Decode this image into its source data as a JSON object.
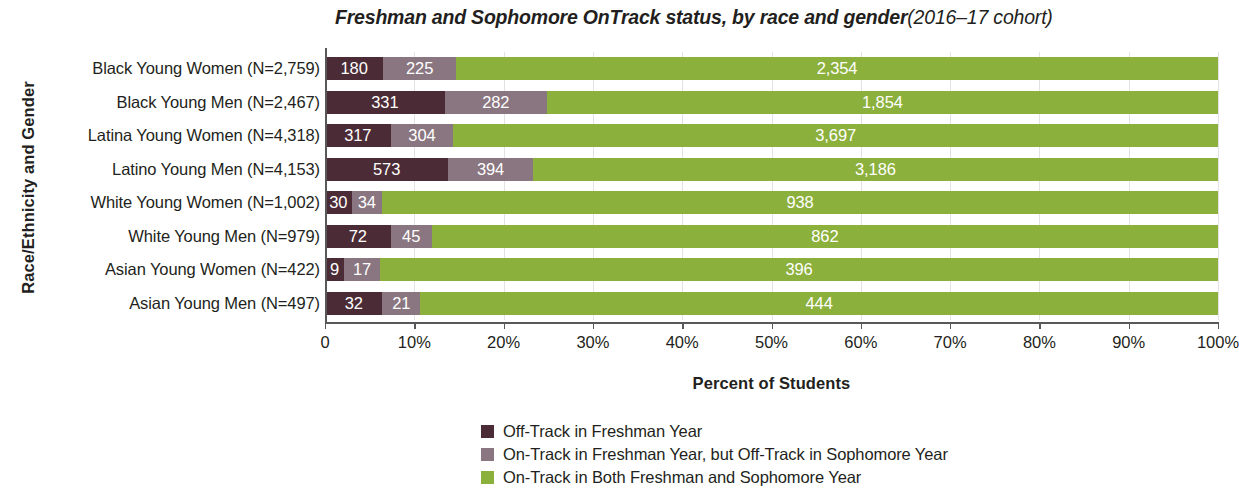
{
  "chart_data": {
    "type": "bar",
    "orientation": "horizontal",
    "stacked": true,
    "normalized": "percent",
    "title_main": "Freshman and Sophomore OnTrack status, by race and gender",
    "title_sub": "(2016–17 cohort)",
    "xlabel": "Percent of Students",
    "ylabel": "Race/Ethnicity and Gender",
    "xlim": [
      0,
      100
    ],
    "xticks": [
      0,
      10,
      20,
      30,
      40,
      50,
      60,
      70,
      80,
      90,
      100
    ],
    "xtick_labels": [
      "0",
      "10%",
      "20%",
      "30%",
      "40%",
      "50%",
      "60%",
      "70%",
      "80%",
      "90%",
      "100%"
    ],
    "grid": true,
    "legend_position": "bottom-center",
    "categories": [
      "Black Young Women (N=2,759)",
      "Black Young Men (N=2,467)",
      "Latina Young Women (N=4,318)",
      "Latino Young Men (N=4,153)",
      "White Young Women (N=1,002)",
      "White Young Men (N=979)",
      "Asian Young Women (N=422)",
      "Asian Young Men (N=497)"
    ],
    "series": [
      {
        "name": "Off-Track in Freshman Year",
        "color": "#4b2c36",
        "values": [
          180,
          331,
          317,
          573,
          30,
          72,
          9,
          32
        ],
        "labels": [
          "180",
          "331",
          "317",
          "573",
          "30",
          "72",
          "9",
          "32"
        ]
      },
      {
        "name": "On-Track in Freshman Year, but Off-Track in Sophomore Year",
        "color": "#8a7680",
        "values": [
          225,
          282,
          304,
          394,
          34,
          45,
          17,
          21
        ],
        "labels": [
          "225",
          "282",
          "304",
          "394",
          "34",
          "45",
          "17",
          "21"
        ]
      },
      {
        "name": "On-Track in Both Freshman and Sophomore Year",
        "color": "#8cb03c",
        "values": [
          2354,
          1854,
          3697,
          3186,
          938,
          862,
          396,
          444
        ],
        "labels": [
          "2,354",
          "1,854",
          "3,697",
          "3,186",
          "938",
          "862",
          "396",
          "444"
        ]
      }
    ],
    "totals": [
      2759,
      2467,
      4318,
      4153,
      1002,
      979,
      422,
      497
    ]
  },
  "legend": {
    "items": [
      {
        "label": "Off-Track in Freshman Year",
        "color": "#4b2c36"
      },
      {
        "label": "On-Track in Freshman Year, but Off-Track in Sophomore Year",
        "color": "#8a7680"
      },
      {
        "label": "On-Track in Both Freshman and Sophomore Year",
        "color": "#8cb03c"
      }
    ]
  },
  "colors": {
    "off_track_freshman": "#4b2c36",
    "off_track_sophomore": "#8a7680",
    "on_track_both": "#8cb03c",
    "axis": "#58585b",
    "grid": "#e3e1e4",
    "text": "#231f20",
    "label_text": "#ffffff"
  }
}
